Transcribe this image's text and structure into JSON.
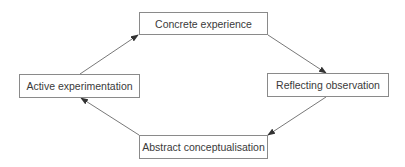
{
  "diagram": {
    "type": "cycle",
    "nodes": [
      {
        "id": "concrete",
        "label": "Concrete experience"
      },
      {
        "id": "reflecting",
        "label": "Reflecting observation"
      },
      {
        "id": "abstract",
        "label": "Abstract conceptualisation"
      },
      {
        "id": "active",
        "label": "Active experimentation"
      }
    ],
    "edges": [
      {
        "from": "concrete",
        "to": "reflecting"
      },
      {
        "from": "reflecting",
        "to": "abstract"
      },
      {
        "from": "abstract",
        "to": "active"
      },
      {
        "from": "active",
        "to": "concrete"
      }
    ],
    "colors": {
      "line": "#555555",
      "border": "#8a8a8a",
      "text": "#3a3a3a"
    }
  }
}
